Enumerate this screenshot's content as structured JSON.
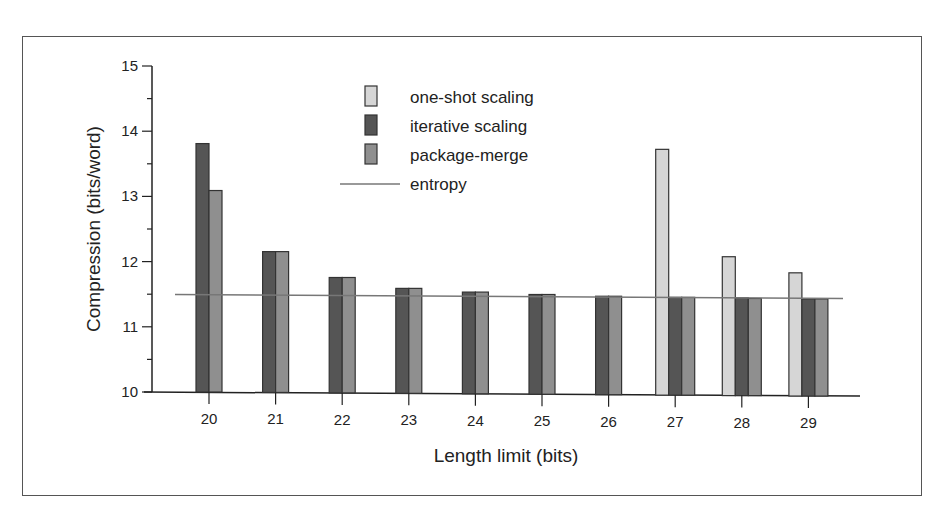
{
  "chart_data": {
    "type": "bar",
    "title": "",
    "xlabel": "Length limit (bits)",
    "ylabel": "Compression (bits/word)",
    "ylim": [
      10,
      15
    ],
    "yticks": [
      10,
      11,
      12,
      13,
      14,
      15
    ],
    "categories": [
      "20",
      "21",
      "22",
      "23",
      "24",
      "25",
      "26",
      "27",
      "28",
      "29"
    ],
    "series": [
      {
        "name": "one-shot scaling",
        "color": "#d6d6d6",
        "values": [
          null,
          null,
          null,
          null,
          null,
          null,
          null,
          13.77,
          12.13,
          11.89
        ]
      },
      {
        "name": "iterative scaling",
        "color": "#555555",
        "values": [
          13.81,
          12.16,
          11.77,
          11.61,
          11.56,
          11.53,
          11.51,
          11.5,
          11.5,
          11.49
        ]
      },
      {
        "name": "package-merge",
        "color": "#8f8f8f",
        "values": [
          13.09,
          12.16,
          11.77,
          11.61,
          11.56,
          11.53,
          11.51,
          11.5,
          11.49,
          11.49
        ]
      }
    ],
    "reference_lines": [
      {
        "name": "entropy",
        "value": 11.48,
        "color": "#777777"
      }
    ],
    "legend": {
      "position": "top-center",
      "entries": [
        "one-shot scaling",
        "iterative scaling",
        "package-merge",
        "entropy"
      ]
    },
    "grid": false
  }
}
